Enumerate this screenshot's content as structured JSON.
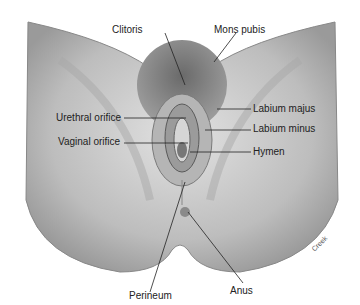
{
  "figure": {
    "labels": {
      "clitoris": "Clitoris",
      "mons_pubis": "Mons pubis",
      "labium_majus": "Labium majus",
      "urethral_orifice": "Urethral orifice",
      "labium_minus": "Labium minus",
      "vaginal_orifice": "Vaginal orifice",
      "hymen": "Hymen",
      "perineum": "Perineum",
      "anus": "Anus"
    },
    "signature": "Creek"
  }
}
